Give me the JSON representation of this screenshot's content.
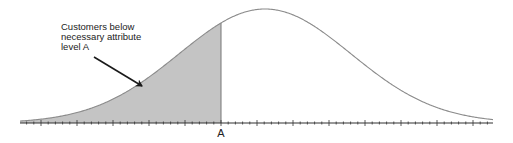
{
  "chart_data": {
    "type": "area",
    "title": "",
    "distribution": {
      "shape": "normal",
      "mean_x_px": 265,
      "sigma_px": 86,
      "peak_y_px": 9,
      "baseline_y_px": 123
    },
    "x_axis": {
      "from_px": 20,
      "to_px": 493,
      "major_tick_spacing_px": 36,
      "minor_ticks_per_major": 5,
      "tick_labels": [
        "A"
      ]
    },
    "shaded_region": {
      "from_px": 20,
      "to_px": 221,
      "label": "A",
      "color": "#c4c4c4"
    },
    "annotation": {
      "lines": [
        "Customers below",
        "necessary attribute",
        "level A"
      ],
      "arrow": {
        "from": [
          94,
          57
        ],
        "to": [
          142,
          86
        ]
      }
    },
    "colors": {
      "curve": "#8a8a8a",
      "axis": "#333333",
      "fill": "#c4c4c4",
      "text": "#222222"
    }
  },
  "annotation": {
    "line1": "Customers below",
    "line2": "necessary attribute",
    "line3": "level A"
  },
  "axis": {
    "label_a": "A"
  }
}
